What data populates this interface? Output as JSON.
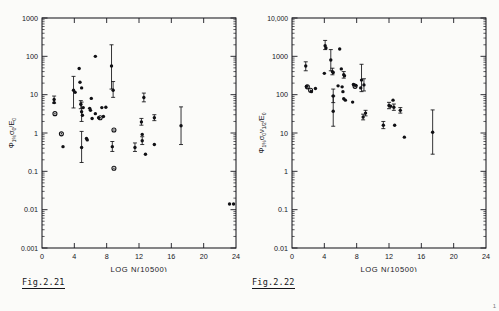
{
  "page": {
    "background": "#fbfbf9",
    "ink": "#16161b",
    "corner_mark": "1"
  },
  "figures": [
    {
      "id": "fig-2-21",
      "caption": "Fig.2.21",
      "chart_data": {
        "type": "scatter",
        "title": "",
        "xlabel": "LOG N(10500)",
        "ylabel": "Φ 1% σ₀ /E₀",
        "ylabel_parts": {
          "symbol": "Φ",
          "sub1": "1%",
          "numerator": "σ",
          "numerator_sub": "0",
          "denominator": "E",
          "denominator_sub": "0"
        },
        "xscale": "linear",
        "yscale": "log",
        "xlim": [
          0,
          24
        ],
        "ylim": [
          0.001,
          1000
        ],
        "xticks": [
          0,
          4,
          8,
          12,
          16,
          20,
          24
        ],
        "xtick_labels": [
          "0",
          "4",
          "8",
          "12",
          "16",
          "20",
          "24"
        ],
        "yticks": [
          0.001,
          0.01,
          0.1,
          1,
          10,
          100,
          1000
        ],
        "ytick_labels": [
          "0.001",
          "0.01",
          "0.1",
          "1",
          "10",
          "100",
          "1000"
        ],
        "grid": false,
        "legend": "none",
        "points": [
          {
            "x": 1.5,
            "y": 7.5,
            "yerr_lo": 6.0,
            "yerr_hi": 9.2,
            "marker": "dot"
          },
          {
            "x": 1.5,
            "y": 6.2,
            "marker": "dot"
          },
          {
            "x": 1.6,
            "y": 3.2,
            "marker": "ring"
          },
          {
            "x": 2.4,
            "y": 0.95,
            "marker": "ring"
          },
          {
            "x": 2.6,
            "y": 0.44,
            "marker": "dot"
          },
          {
            "x": 3.9,
            "y": 13.0,
            "yerr_lo": 4.5,
            "yerr_hi": 30.0,
            "marker": "dot"
          },
          {
            "x": 4.1,
            "y": 11.5,
            "marker": "dot"
          },
          {
            "x": 4.6,
            "y": 48.0,
            "marker": "dot"
          },
          {
            "x": 4.7,
            "y": 21.0,
            "marker": "dot"
          },
          {
            "x": 4.9,
            "y": 15.0,
            "marker": "dot"
          },
          {
            "x": 4.8,
            "y": 5.6,
            "yerr_lo": 4.3,
            "yerr_hi": 7.0,
            "marker": "dot"
          },
          {
            "x": 4.9,
            "y": 3.6,
            "yerr_lo": 2.0,
            "yerr_hi": 6.4,
            "marker": "dot"
          },
          {
            "x": 5.1,
            "y": 4.6,
            "marker": "dot"
          },
          {
            "x": 5.0,
            "y": 2.9,
            "marker": "dot"
          },
          {
            "x": 4.9,
            "y": 0.42,
            "yerr_lo": 0.17,
            "yerr_hi": 1.1,
            "marker": "dot"
          },
          {
            "x": 5.5,
            "y": 0.72,
            "marker": "dot"
          },
          {
            "x": 5.6,
            "y": 0.66,
            "marker": "dot"
          },
          {
            "x": 5.9,
            "y": 4.4,
            "marker": "dot"
          },
          {
            "x": 6.0,
            "y": 3.9,
            "marker": "dot"
          },
          {
            "x": 6.1,
            "y": 8.0,
            "marker": "dot"
          },
          {
            "x": 6.2,
            "y": 2.4,
            "marker": "dot"
          },
          {
            "x": 6.6,
            "y": 3.2,
            "marker": "dot"
          },
          {
            "x": 7.0,
            "y": 2.5,
            "marker": "dot"
          },
          {
            "x": 7.2,
            "y": 2.5,
            "marker": "ring"
          },
          {
            "x": 7.6,
            "y": 2.7,
            "marker": "dot"
          },
          {
            "x": 7.4,
            "y": 4.6,
            "marker": "dot"
          },
          {
            "x": 7.9,
            "y": 4.7,
            "marker": "dot"
          },
          {
            "x": 6.6,
            "y": 100.0,
            "marker": "dot"
          },
          {
            "x": 8.6,
            "y": 56.0,
            "yerr_lo": 14.0,
            "yerr_hi": 200.0,
            "marker": "dot"
          },
          {
            "x": 8.8,
            "y": 13.0,
            "yerr_lo": 8.5,
            "yerr_hi": 22.0,
            "marker": "dot"
          },
          {
            "x": 8.9,
            "y": 1.2,
            "marker": "ring"
          },
          {
            "x": 8.7,
            "y": 0.44,
            "yerr_lo": 0.33,
            "yerr_hi": 0.6,
            "marker": "dot"
          },
          {
            "x": 8.9,
            "y": 0.12,
            "marker": "ring"
          },
          {
            "x": 11.5,
            "y": 0.42,
            "yerr_lo": 0.33,
            "yerr_hi": 0.55,
            "marker": "dot"
          },
          {
            "x": 12.3,
            "y": 1.95,
            "yerr_lo": 1.6,
            "yerr_hi": 2.4,
            "marker": "dot"
          },
          {
            "x": 12.4,
            "y": 0.92,
            "marker": "dot"
          },
          {
            "x": 12.4,
            "y": 0.63,
            "yerr_lo": 0.5,
            "yerr_hi": 0.8,
            "marker": "dot"
          },
          {
            "x": 12.6,
            "y": 8.4,
            "yerr_lo": 6.5,
            "yerr_hi": 11.0,
            "marker": "dot"
          },
          {
            "x": 12.8,
            "y": 0.28,
            "marker": "dot"
          },
          {
            "x": 13.9,
            "y": 2.5,
            "yerr_lo": 2.1,
            "yerr_hi": 3.0,
            "marker": "dot"
          },
          {
            "x": 13.9,
            "y": 0.5,
            "marker": "dot"
          },
          {
            "x": 17.2,
            "y": 1.55,
            "yerr_lo": 0.5,
            "yerr_hi": 4.8,
            "marker": "dot"
          },
          {
            "x": 23.2,
            "y": 0.014,
            "marker": "dot"
          },
          {
            "x": 23.7,
            "y": 0.014,
            "marker": "dot"
          }
        ]
      }
    },
    {
      "id": "fig-2-22",
      "caption": "Fig.2.22",
      "chart_data": {
        "type": "scatter",
        "title": "",
        "xlabel": "LOG N(10500)",
        "ylabel": "Φ 1% σ₀ ν1/2 /E₀",
        "ylabel_parts": {
          "symbol": "Φ",
          "sub1": "1%",
          "numerator": "σ",
          "numerator_sub": "0",
          "numerator2": "ν",
          "numerator2_sub": "1/2",
          "denominator": "E",
          "denominator_sub": "0"
        },
        "xscale": "linear",
        "yscale": "log",
        "xlim": [
          0,
          24
        ],
        "ylim": [
          0.01,
          10000
        ],
        "xticks": [
          0,
          4,
          8,
          12,
          16,
          20,
          24
        ],
        "xtick_labels": [
          "0",
          "4",
          "8",
          "12",
          "16",
          "20",
          "24"
        ],
        "yticks": [
          0.01,
          0.1,
          1,
          10,
          100,
          1000,
          10000
        ],
        "ytick_labels": [
          "0.01",
          "0.1",
          "1",
          "10",
          "100",
          "1000",
          "10,000"
        ],
        "grid": false,
        "legend": "none",
        "points": [
          {
            "x": 1.7,
            "y": 560.0,
            "yerr_lo": 420.0,
            "yerr_hi": 720.0,
            "marker": "dot"
          },
          {
            "x": 1.8,
            "y": 165.0,
            "marker": "dot"
          },
          {
            "x": 1.9,
            "y": 160.0,
            "marker": "ring"
          },
          {
            "x": 2.3,
            "y": 130.0,
            "marker": "ring"
          },
          {
            "x": 2.4,
            "y": 120.0,
            "marker": "dot"
          },
          {
            "x": 2.9,
            "y": 145.0,
            "marker": "dot"
          },
          {
            "x": 4.1,
            "y": 1900.0,
            "yerr_lo": 1500.0,
            "yerr_hi": 2600.0,
            "marker": "dot"
          },
          {
            "x": 4.2,
            "y": 1650.0,
            "marker": "dot"
          },
          {
            "x": 4.0,
            "y": 360.0,
            "marker": "dot"
          },
          {
            "x": 4.8,
            "y": 800.0,
            "yerr_lo": 420.0,
            "yerr_hi": 1500.0,
            "marker": "dot"
          },
          {
            "x": 5.0,
            "y": 400.0,
            "yerr_lo": 330.0,
            "yerr_hi": 490.0,
            "marker": "dot"
          },
          {
            "x": 5.1,
            "y": 380.0,
            "marker": "dot"
          },
          {
            "x": 5.1,
            "y": 92.0,
            "yerr_lo": 62.0,
            "yerr_hi": 140.0,
            "marker": "dot"
          },
          {
            "x": 5.1,
            "y": 37.0,
            "yerr_lo": 15.0,
            "yerr_hi": 92.0,
            "marker": "dot"
          },
          {
            "x": 5.9,
            "y": 1550.0,
            "marker": "dot"
          },
          {
            "x": 6.1,
            "y": 470.0,
            "marker": "dot"
          },
          {
            "x": 6.4,
            "y": 330.0,
            "yerr_lo": 270.0,
            "yerr_hi": 400.0,
            "marker": "dot"
          },
          {
            "x": 6.5,
            "y": 310.0,
            "marker": "dot"
          },
          {
            "x": 6.2,
            "y": 160.0,
            "marker": "dot"
          },
          {
            "x": 6.3,
            "y": 120.0,
            "marker": "dot"
          },
          {
            "x": 6.4,
            "y": 78.0,
            "marker": "dot"
          },
          {
            "x": 6.6,
            "y": 72.0,
            "marker": "dot"
          },
          {
            "x": 5.7,
            "y": 170.0,
            "marker": "dot"
          },
          {
            "x": 7.6,
            "y": 185.0,
            "marker": "dot"
          },
          {
            "x": 7.7,
            "y": 180.0,
            "marker": "dot"
          },
          {
            "x": 7.9,
            "y": 175.0,
            "marker": "dot"
          },
          {
            "x": 7.8,
            "y": 165.0,
            "marker": "ring"
          },
          {
            "x": 7.5,
            "y": 64.0,
            "marker": "dot"
          },
          {
            "x": 8.6,
            "y": 240.0,
            "yerr_lo": 120.0,
            "yerr_hi": 620.0,
            "marker": "dot"
          },
          {
            "x": 8.9,
            "y": 180.0,
            "yerr_lo": 125.0,
            "yerr_hi": 260.0,
            "marker": "dot"
          },
          {
            "x": 8.5,
            "y": 150.0,
            "marker": "dot"
          },
          {
            "x": 8.8,
            "y": 26.0,
            "yerr_lo": 22.0,
            "yerr_hi": 31.0,
            "marker": "dot"
          },
          {
            "x": 9.1,
            "y": 33.0,
            "yerr_lo": 28.0,
            "yerr_hi": 39.0,
            "marker": "dot"
          },
          {
            "x": 11.3,
            "y": 16.0,
            "yerr_lo": 13.0,
            "yerr_hi": 20.0,
            "marker": "dot"
          },
          {
            "x": 12.0,
            "y": 52.0,
            "yerr_lo": 43.0,
            "yerr_hi": 63.0,
            "marker": "dot"
          },
          {
            "x": 12.2,
            "y": 50.0,
            "marker": "dot"
          },
          {
            "x": 12.5,
            "y": 72.0,
            "marker": "dot"
          },
          {
            "x": 12.6,
            "y": 47.0,
            "yerr_lo": 39.0,
            "yerr_hi": 57.0,
            "marker": "dot"
          },
          {
            "x": 12.7,
            "y": 16.0,
            "marker": "dot"
          },
          {
            "x": 13.4,
            "y": 39.0,
            "yerr_lo": 33.0,
            "yerr_hi": 46.0,
            "marker": "dot"
          },
          {
            "x": 13.9,
            "y": 7.8,
            "marker": "dot"
          },
          {
            "x": 17.4,
            "y": 10.5,
            "yerr_lo": 2.8,
            "yerr_hi": 40.0,
            "marker": "dot"
          }
        ]
      }
    }
  ]
}
